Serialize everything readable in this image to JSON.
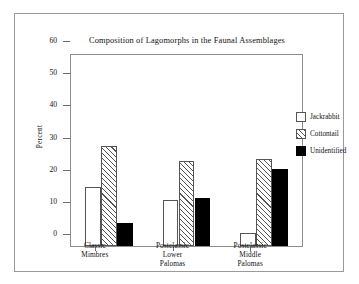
{
  "figure": {
    "title": "Composition of Lagomorphs in the Faunal Assemblages"
  },
  "chart_data": {
    "type": "bar",
    "title": "Composition of Lagomorphs in the Faunal Assemblages",
    "xlabel": "",
    "ylabel": "Percent",
    "ylim": [
      0,
      60
    ],
    "yticks": [
      0,
      10,
      20,
      30,
      40,
      50,
      60
    ],
    "ytick_labels": [
      "0",
      "10",
      "20",
      "30",
      "40",
      "50",
      "60"
    ],
    "grid": false,
    "legend_position": "right",
    "categories": [
      "Classic Mimbres",
      "Postclassic Lower Palomas",
      "Postclassic Middle Palomas"
    ],
    "category_lines": [
      [
        "Classic",
        "Mimbres"
      ],
      [
        "Postclassic",
        "Lower",
        "Palomas"
      ],
      [
        "Postclassic",
        "Middle",
        "Palomas"
      ]
    ],
    "series": [
      {
        "name": "Jackrabbit",
        "values": [
          18.3,
          14.3,
          4.0
        ],
        "fill": "white",
        "color": "#ffffff"
      },
      {
        "name": "Cottontail",
        "values": [
          31.2,
          26.4,
          27.2
        ],
        "fill": "hatch",
        "color": "#555555"
      },
      {
        "name": "Unidentified",
        "values": [
          7.2,
          14.8,
          23.8
        ],
        "fill": "solid",
        "color": "#000000"
      }
    ]
  },
  "legend": {
    "items": [
      {
        "label": "Jackrabbit"
      },
      {
        "label": "Cottontail"
      },
      {
        "label": "Unidentified"
      }
    ]
  }
}
